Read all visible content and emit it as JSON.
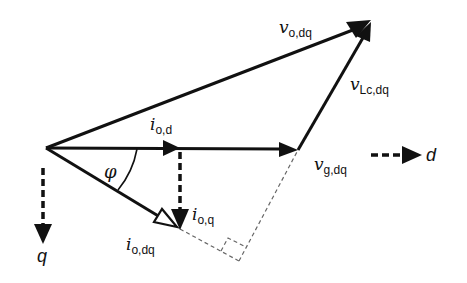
{
  "diagram": {
    "type": "phasor",
    "colors": {
      "stroke": "#111111",
      "guide": "#666666",
      "background": "#ffffff"
    },
    "vectors": [
      {
        "id": "v_o_dq",
        "symbol": "v",
        "subscript": "o,dq"
      },
      {
        "id": "v_Lc_dq",
        "symbol": "v",
        "subscript": "Lc,dq"
      },
      {
        "id": "v_g_dq",
        "symbol": "v",
        "subscript": "g,dq"
      },
      {
        "id": "i_o_d",
        "symbol": "i",
        "subscript": "o,d"
      },
      {
        "id": "i_o_q",
        "symbol": "i",
        "subscript": "o,q"
      },
      {
        "id": "i_o_dq",
        "symbol": "i",
        "subscript": "o,dq"
      }
    ],
    "angle": {
      "symbol": "φ"
    },
    "axes": {
      "d": "d",
      "q": "q"
    }
  }
}
